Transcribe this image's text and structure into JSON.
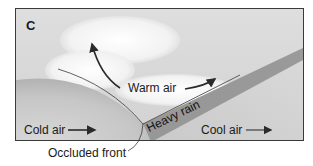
{
  "figure": {
    "panel_label": "C",
    "labels": {
      "warm_air": "Warm air",
      "heavy_rain": "Heavy rain",
      "cold_air": "Cold air",
      "cool_air": "Cool air",
      "occluded_front": "Occluded front"
    },
    "colors": {
      "background": "#d6d6d6",
      "cloud": "#f7f7f7",
      "cold_air_mass": "#c4c4c4",
      "cool_air_mass": "#cfcfcf",
      "rain_band": "#8e8e8e",
      "border": "#3a3a3a",
      "arrow": "#2a2a2a"
    }
  }
}
